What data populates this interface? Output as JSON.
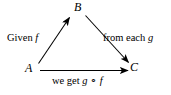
{
  "figure": {
    "type": "commutative-triangle-diagram",
    "background_color": "#ffffff",
    "ink_color": "#000000",
    "width": 171,
    "height": 95
  },
  "vertices": [
    {
      "id": "B",
      "label": "B",
      "x": 78,
      "y": 8
    },
    {
      "id": "A",
      "label": "A",
      "x": 30,
      "y": 68
    },
    {
      "id": "C",
      "label": "C",
      "x": 134,
      "y": 67
    }
  ],
  "edges": [
    {
      "id": "a-to-b",
      "from": "A",
      "to": "B",
      "label": "Given f",
      "label_plain": "Given",
      "label_italic": "f",
      "arrow": "to-b"
    },
    {
      "id": "b-to-c",
      "from": "B",
      "to": "C",
      "label": "from each g",
      "label_plain": "from each",
      "label_italic": "g",
      "arrow": "to-c"
    },
    {
      "id": "a-to-c",
      "from": "A",
      "to": "C",
      "label": "we get g ∘ f",
      "label_plain": "we get",
      "label_italic_1": "g",
      "label_operator": "∘",
      "label_italic_2": "f",
      "arrow": "to-c"
    }
  ],
  "labels": {
    "left": "Given",
    "left_symbol": "f",
    "right": "from each",
    "right_symbol": "g",
    "bottom": "we get",
    "bottom_symbol_1": "g",
    "bottom_operator": "∘",
    "bottom_symbol_2": "f"
  }
}
